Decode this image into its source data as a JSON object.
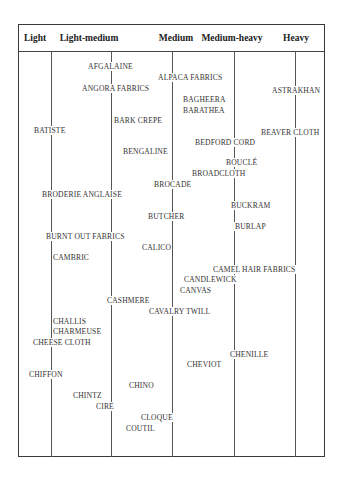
{
  "table": {
    "columns": [
      {
        "label": "Light",
        "center_x": 35
      },
      {
        "label": "Light-medium",
        "center_x": 89
      },
      {
        "label": "Medium",
        "center_x": 176
      },
      {
        "label": "Medium-heavy",
        "center_x": 232
      },
      {
        "label": "Heavy",
        "center_x": 296
      }
    ],
    "fabrics": [
      {
        "name": "AFGALAINE",
        "x": 87,
        "y": 62
      },
      {
        "name": "ALPACA FABRICS",
        "x": 157,
        "y": 73
      },
      {
        "name": "ANGORA FABRICS",
        "x": 81,
        "y": 84
      },
      {
        "name": "ASTRAKHAN",
        "x": 271,
        "y": 86
      },
      {
        "name": "BAGHEERA",
        "x": 182,
        "y": 95
      },
      {
        "name": "BARATHEA",
        "x": 182,
        "y": 106
      },
      {
        "name": "BARK CREPE",
        "x": 113,
        "y": 116
      },
      {
        "name": "BATISTE",
        "x": 33,
        "y": 126
      },
      {
        "name": "BEAVER CLOTH",
        "x": 260,
        "y": 128
      },
      {
        "name": "BEDFORD CORD",
        "x": 194,
        "y": 138
      },
      {
        "name": "BENGALINE",
        "x": 122,
        "y": 147
      },
      {
        "name": "BOUCLÉ",
        "x": 225,
        "y": 158
      },
      {
        "name": "BROADCLOTH",
        "x": 191,
        "y": 169
      },
      {
        "name": "BROCADE",
        "x": 153,
        "y": 180
      },
      {
        "name": "BRODERIE ANGLAISE",
        "x": 41,
        "y": 190
      },
      {
        "name": "BUCKRAM",
        "x": 230,
        "y": 201
      },
      {
        "name": "BUTCHER",
        "x": 147,
        "y": 212
      },
      {
        "name": "BURLAP",
        "x": 234,
        "y": 222
      },
      {
        "name": "BURNT OUT FABRICS",
        "x": 45,
        "y": 232
      },
      {
        "name": "CALICO",
        "x": 141,
        "y": 243
      },
      {
        "name": "CAMBRIC",
        "x": 52,
        "y": 253
      },
      {
        "name": "CAMEL HAIR FABRICS",
        "x": 212,
        "y": 265
      },
      {
        "name": "CANDLEWICK",
        "x": 183,
        "y": 275
      },
      {
        "name": "CANVAS",
        "x": 179,
        "y": 286
      },
      {
        "name": "CASHMERE",
        "x": 106,
        "y": 296
      },
      {
        "name": "CAVALRY TWILL",
        "x": 148,
        "y": 307
      },
      {
        "name": "CHALLIS",
        "x": 52,
        "y": 317
      },
      {
        "name": "CHARMEUSE",
        "x": 52,
        "y": 327
      },
      {
        "name": "CHEESE CLOTH",
        "x": 32,
        "y": 338
      },
      {
        "name": "CHENILLE",
        "x": 229,
        "y": 350
      },
      {
        "name": "CHEVIOT",
        "x": 186,
        "y": 360
      },
      {
        "name": "CHIFFON",
        "x": 28,
        "y": 370
      },
      {
        "name": "CHINO",
        "x": 128,
        "y": 381
      },
      {
        "name": "CHINTZ",
        "x": 72,
        "y": 391
      },
      {
        "name": "CIRE",
        "x": 95,
        "y": 402
      },
      {
        "name": "CLOQUE",
        "x": 140,
        "y": 413
      },
      {
        "name": "COUTIL",
        "x": 125,
        "y": 424
      }
    ],
    "column_lines_x": [
      51,
      111,
      172,
      234,
      295
    ]
  }
}
